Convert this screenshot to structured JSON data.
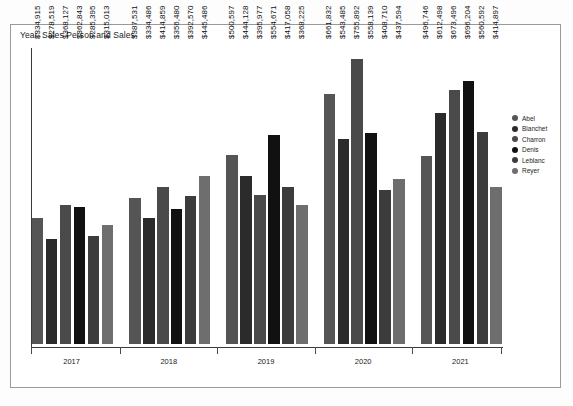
{
  "chart_title": "Year, Sales Person and Sales",
  "legend": {
    "position": "right",
    "items": [
      {
        "label": "Abel",
        "color": "#555555"
      },
      {
        "label": "Blanchet",
        "color": "#2b2b2b"
      },
      {
        "label": "Charron",
        "color": "#4a4a4a"
      },
      {
        "label": "Denis",
        "color": "#111111"
      },
      {
        "label": "Leblanc",
        "color": "#3c3c3c"
      },
      {
        "label": "Reyer",
        "color": "#6e6e6e"
      }
    ]
  },
  "axis": {
    "year_labels": [
      "2017",
      "2018",
      "2019",
      "2020",
      "2021"
    ]
  },
  "chart_data": {
    "type": "bar",
    "title": "Year, Sales Person and Sales",
    "xlabel": "",
    "ylabel": "",
    "grid": false,
    "legend_position": "right",
    "ylim": [
      0,
      800000
    ],
    "categories": [
      "2017",
      "2018",
      "2019",
      "2020",
      "2021"
    ],
    "series": [
      {
        "name": "Abel",
        "color": "#555555",
        "values": [
          334915,
          387531,
          500597,
          661832,
          496746
        ]
      },
      {
        "name": "Blanchet",
        "color": "#2b2b2b",
        "values": [
          278519,
          334486,
          444128,
          543485,
          612498
        ]
      },
      {
        "name": "Charron",
        "color": "#4a4a4a",
        "values": [
          368127,
          414859,
          395977,
          755892,
          673496
        ]
      },
      {
        "name": "Denis",
        "color": "#111111",
        "values": [
          362843,
          356480,
          554671,
          558139,
          696204
        ]
      },
      {
        "name": "Leblanc",
        "color": "#3c3c3c",
        "values": [
          285395,
          392570,
          417058,
          408710,
          560592
        ]
      },
      {
        "name": "Reyer",
        "color": "#6e6e6e",
        "values": [
          315013,
          445486,
          368225,
          437594,
          414897
        ]
      }
    ],
    "value_labels": [
      [
        "$334,915",
        "$278,519",
        "$368,127",
        "$362,843",
        "$285,395",
        "$315,013"
      ],
      [
        "$387,531",
        "$334,486",
        "$414,859",
        "$356,480",
        "$392,570",
        "$445,486"
      ],
      [
        "$500,597",
        "$444,128",
        "$395,977",
        "$554,671",
        "$417,058",
        "$368,225"
      ],
      [
        "$661,832",
        "$543,485",
        "$755,892",
        "$558,139",
        "$408,710",
        "$437,594"
      ],
      [
        "$496,746",
        "$612,498",
        "$673,496",
        "$696,204",
        "$560,592",
        "$414,897"
      ]
    ]
  }
}
